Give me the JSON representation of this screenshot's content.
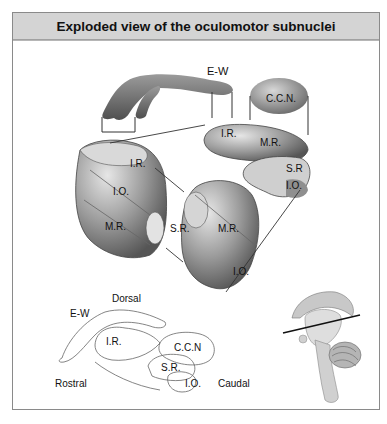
{
  "figure": {
    "title": "Exploded view of the oculomotor subnuclei",
    "exploded_labels": {
      "ew": "E-W",
      "ccn": "C.C.N.",
      "ir_top": "I.R.",
      "mr_top": "M.R.",
      "sr_top": "S.R",
      "io_top": "I.O.",
      "ir_left": "I.R.",
      "io_left": "I.O.",
      "mr_left": "M.R.",
      "sr_left": "S.R.",
      "mr_center": "M.R.",
      "io_center": "I.O."
    },
    "schematic_labels": {
      "dorsal": "Dorsal",
      "ew": "E-W",
      "ir": "I.R.",
      "ccn": "C.C.N",
      "sr": "S.R.",
      "io": "I.O.",
      "rostral": "Rostral",
      "caudal": "Caudal"
    },
    "inset": "brainstem-section-locator"
  }
}
